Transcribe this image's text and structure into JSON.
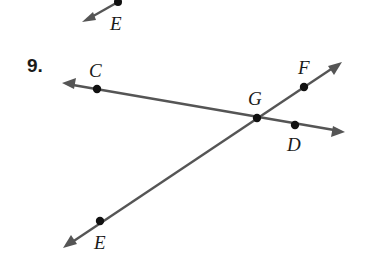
{
  "problem": {
    "number": "9."
  },
  "colors": {
    "line": "#555555",
    "point": "#111111",
    "text": "#1a1a1a",
    "background": "#ffffff"
  },
  "points": {
    "C": {
      "label": "C",
      "x": 97,
      "y": 89
    },
    "D": {
      "label": "D",
      "x": 295,
      "y": 125
    },
    "E": {
      "label": "E",
      "x": 100,
      "y": 221
    },
    "F": {
      "label": "F",
      "x": 304,
      "y": 87
    },
    "G": {
      "label": "G",
      "x": 257,
      "y": 118
    }
  },
  "lines": [
    {
      "name": "line-CD",
      "through": [
        "C",
        "G",
        "D"
      ],
      "from": [
        62,
        83
      ],
      "to": [
        345,
        132
      ],
      "arrows": "both"
    },
    {
      "name": "line-EF",
      "through": [
        "E",
        "G",
        "F"
      ],
      "from": [
        63,
        248
      ],
      "to": [
        342,
        62
      ],
      "arrows": "both"
    }
  ],
  "previous_problem_fragment": {
    "point_label": "E",
    "point": {
      "x": 118,
      "y": 2
    },
    "arrow_tip": [
      82,
      22
    ]
  }
}
